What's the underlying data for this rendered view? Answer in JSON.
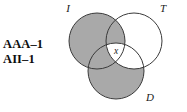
{
  "figure": {
    "type": "venn-3-circle",
    "background_color": "#ffffff",
    "shade_color": "#a9a9a9",
    "stroke_color": "#3a3a3a",
    "text_color": "#1a1a1a"
  },
  "syllogism": {
    "line1": "AAA–1",
    "line2": "AII–1"
  },
  "venn": {
    "circles": [
      {
        "id": "I",
        "label": "I",
        "cx": 97,
        "cy": 41,
        "r": 28,
        "shaded": true,
        "label_x": 68,
        "label_y": 12
      },
      {
        "id": "T",
        "label": "T",
        "cx": 134,
        "cy": 41,
        "r": 28,
        "shaded": false,
        "label_x": 163,
        "label_y": 12
      },
      {
        "id": "D",
        "label": "D",
        "cx": 116,
        "cy": 71,
        "r": 28,
        "shaded": true,
        "label_x": 150,
        "label_y": 101
      }
    ],
    "center_mark": {
      "label": "x",
      "x": 116,
      "y": 54,
      "region": "I∩T∩D",
      "filled": false
    },
    "shaded_regions": [
      "I",
      "D"
    ],
    "unshaded_regions": [
      "T-only",
      "I∩T∩D",
      "T∩D-only"
    ]
  }
}
